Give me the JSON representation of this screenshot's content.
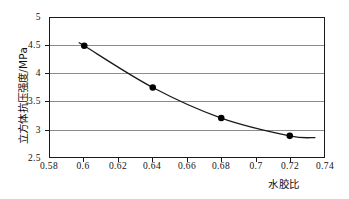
{
  "chart_data": {
    "type": "line",
    "title": "",
    "xlabel": "水胶比",
    "ylabel": "立方体抗压强度/MPa",
    "x": [
      0.6,
      0.64,
      0.68,
      0.72
    ],
    "values": [
      4.5,
      3.75,
      3.2,
      2.88
    ],
    "series": [
      {
        "name": "立方体抗压强度",
        "x": [
          0.6,
          0.64,
          0.68,
          0.72
        ],
        "values": [
          4.5,
          3.75,
          3.2,
          2.88
        ]
      }
    ],
    "xlim": [
      0.58,
      0.74
    ],
    "ylim": [
      2.5,
      5.0
    ],
    "xticks": [
      0.58,
      0.6,
      0.62,
      0.64,
      0.66,
      0.68,
      0.7,
      0.72,
      0.74
    ],
    "yticks": [
      2.5,
      3.0,
      3.5,
      4.0,
      4.5,
      5.0
    ],
    "xtick_labels": [
      "0.58",
      "0.6",
      "0.62",
      "0.64",
      "0.66",
      "0.68",
      "0.7",
      "0.72",
      "0.74"
    ],
    "ytick_labels": [
      "2.5",
      "3",
      "3.5",
      "4",
      "4.5",
      "5"
    ],
    "gridlines_y": [
      3.0,
      3.5,
      4.0,
      4.5
    ],
    "grid": true,
    "legend": null,
    "marker": "filled-circle",
    "line_color": "#1a1a1a",
    "marker_color": "#000000",
    "grid_color": "#8c8c8c",
    "frame_color": "#1a1a1a",
    "background": "#ffffff"
  }
}
